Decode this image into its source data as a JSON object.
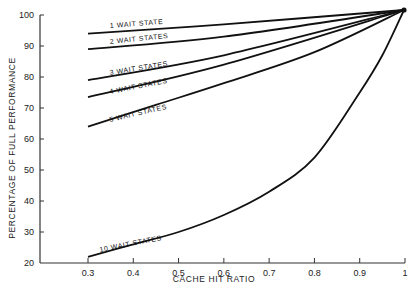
{
  "chart_data": {
    "type": "line",
    "title": "",
    "xlabel": "CACHE HIT RATIO",
    "ylabel": "PERCENTAGE OF FULL PERFORMANCE",
    "xlim": [
      0.3,
      1.0
    ],
    "ylim": [
      20,
      100
    ],
    "grid": false,
    "legend": "inline labels",
    "x_ticks": [
      "0.3",
      "0.4",
      "0.5",
      "0.6",
      "0.7",
      "0.8",
      "0.9",
      "1"
    ],
    "y_ticks": [
      "20",
      "30",
      "40",
      "50",
      "60",
      "70",
      "80",
      "90",
      "100"
    ],
    "series": [
      {
        "name": "1 WAIT STATE",
        "x": [
          0.3,
          0.6,
          1.0
        ],
        "values": [
          94,
          97,
          100
        ]
      },
      {
        "name": "2 WAIT STATES",
        "x": [
          0.3,
          0.6,
          1.0
        ],
        "values": [
          89,
          93,
          100
        ]
      },
      {
        "name": "3 WAIT STATES",
        "x": [
          0.3,
          0.6,
          1.0
        ],
        "values": [
          79,
          87,
          100
        ]
      },
      {
        "name": "4 WAIT STATES",
        "x": [
          0.3,
          0.6,
          1.0
        ],
        "values": [
          73.5,
          84,
          100
        ]
      },
      {
        "name": "5 WAIT STATES",
        "x": [
          0.3,
          0.45,
          0.6,
          0.8,
          1.0
        ],
        "values": [
          64,
          71,
          78,
          88,
          100
        ]
      },
      {
        "name": "10 WAIT STATES",
        "x": [
          0.3,
          0.4,
          0.5,
          0.6,
          0.7,
          0.8,
          0.9,
          0.95,
          1.0
        ],
        "values": [
          22,
          26,
          30,
          35.5,
          43,
          54,
          75,
          87,
          100
        ]
      }
    ]
  }
}
